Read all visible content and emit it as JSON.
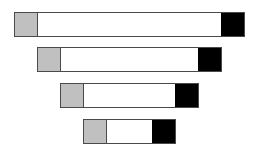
{
  "diagram": {
    "colors": {
      "left_segment": "#c0c0c0",
      "middle_segment": "#ffffff",
      "right_segment": "#000000",
      "border": "#4a4a4a"
    },
    "bars": [
      {
        "id": "bar-1",
        "segments": [
          "gray",
          "white",
          "black"
        ]
      },
      {
        "id": "bar-2",
        "segments": [
          "gray",
          "white",
          "black"
        ]
      },
      {
        "id": "bar-3",
        "segments": [
          "gray",
          "white",
          "black"
        ]
      },
      {
        "id": "bar-4",
        "segments": [
          "gray",
          "white",
          "black"
        ]
      }
    ]
  }
}
